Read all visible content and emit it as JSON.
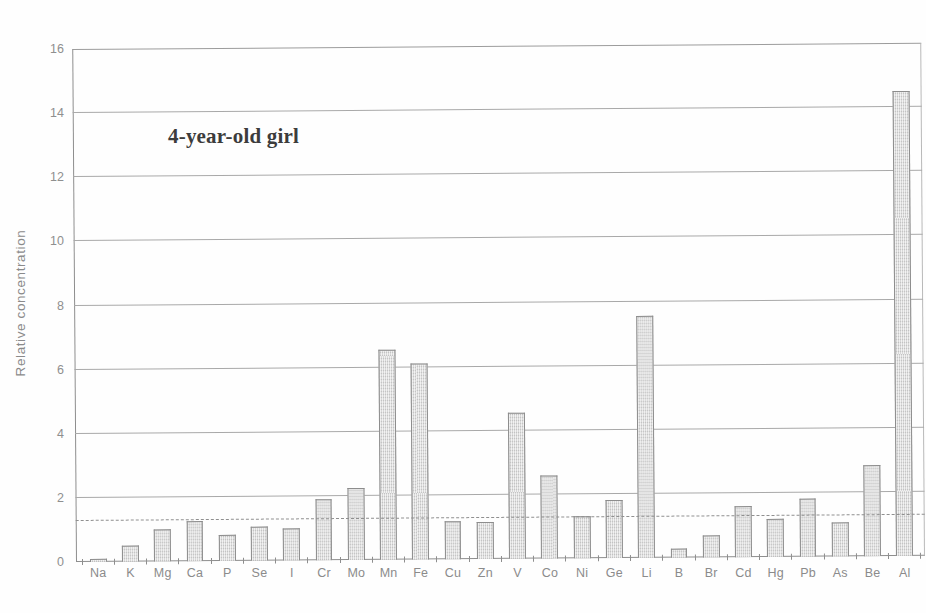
{
  "chart_data": {
    "type": "bar",
    "title": "",
    "annotation": "4-year-old girl",
    "xlabel": "",
    "ylabel": "Relative concentration",
    "ylim": [
      0,
      16
    ],
    "ytick_step": 2,
    "yticks": [
      "16",
      "14",
      "12",
      "10",
      "8",
      "6",
      "4",
      "2",
      "0"
    ],
    "grid": "horizontal",
    "legend": "none",
    "reference_line": {
      "value": 1.28,
      "style": "dashed",
      "color": "#8f8f8f"
    },
    "bar_color": "#d5d5d5",
    "bar_border_color": "#8d8d8d",
    "axis_color": "#8e8e8e",
    "categories": [
      "Na",
      "K",
      "Mg",
      "Ca",
      "P",
      "Se",
      "I",
      "Cr",
      "Mo",
      "Mn",
      "Fe",
      "Cu",
      "Zn",
      "V",
      "Co",
      "Ni",
      "Ge",
      "Li",
      "B",
      "Br",
      "Cd",
      "Hg",
      "Pb",
      "As",
      "Be",
      "Al"
    ],
    "values": [
      0.08,
      0.5,
      1.0,
      1.25,
      0.8,
      1.05,
      1.0,
      1.9,
      2.25,
      6.55,
      6.1,
      1.2,
      1.15,
      4.55,
      2.6,
      1.3,
      1.8,
      7.55,
      0.27,
      0.7,
      1.6,
      1.2,
      1.8,
      1.05,
      2.85,
      14.5
    ]
  }
}
